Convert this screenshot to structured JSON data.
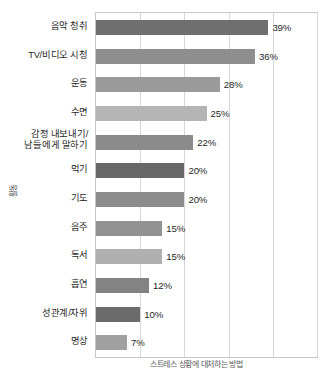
{
  "chart_data": {
    "type": "bar",
    "orientation": "horizontal",
    "title": "",
    "xlabel": "",
    "ylabel": "활동",
    "categories": [
      "음악 청취",
      "TV/비디오 시청",
      "운동",
      "수면",
      "감정 내보내기/\n남들에게 말하기",
      "먹기",
      "기도",
      "음주",
      "독서",
      "흡연",
      "성관계/자위",
      "명상"
    ],
    "values": [
      39,
      36,
      28,
      25,
      22,
      20,
      20,
      15,
      15,
      12,
      10,
      7
    ],
    "data_labels": [
      "39%",
      "36%",
      "28%",
      "25%",
      "22%",
      "20%",
      "20%",
      "15%",
      "15%",
      "12%",
      "10%",
      "7%"
    ],
    "bar_colors": [
      "#6f6f6f",
      "#8e8e8e",
      "#9a9a9a",
      "#b4b4b4",
      "#8a8a8a",
      "#676767",
      "#8c8c8c",
      "#929292",
      "#b0b0b0",
      "#838383",
      "#6b6b6b",
      "#a0a0a0"
    ],
    "xlim": [
      0,
      50
    ],
    "xticks": [
      0,
      10,
      20,
      30,
      40,
      50
    ],
    "grid": "vertical",
    "legend": "none",
    "axis_tick_labels_visible": false
  },
  "caption": {
    "text": "스트레스 상황에 대처하는 방법"
  }
}
